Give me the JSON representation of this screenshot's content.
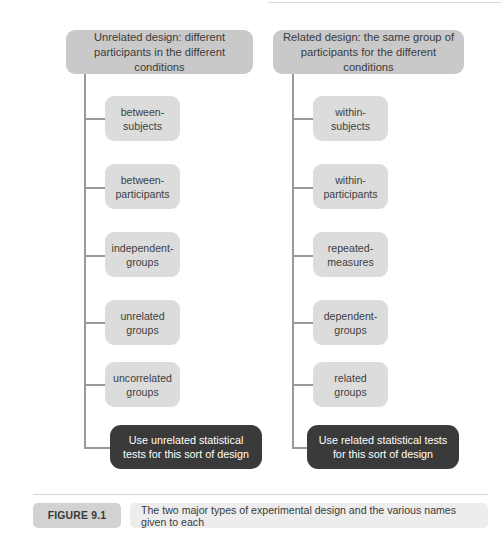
{
  "figure": {
    "columns": [
      {
        "id": "unrelated",
        "header": "Unrelated design: different participants in the different conditions",
        "nodes": [
          "between-subjects",
          "between-participants",
          "independent-groups",
          "unrelated groups",
          "uncorrelated groups"
        ],
        "conclusion": "Use unrelated statistical tests for this sort of design"
      },
      {
        "id": "related",
        "header": "Related design: the same group of participants for the different conditions",
        "nodes": [
          "within-subjects",
          "within-participants",
          "repeated-measures",
          "dependent-groups",
          "related groups"
        ],
        "conclusion": "Use related statistical tests for this sort of design"
      }
    ],
    "caption": {
      "label": "FIGURE 9.1",
      "text": "The two major types of experimental design and the various names given to each"
    },
    "colors": {
      "header_box": "#c9c9c9",
      "node_box": "#dcdcdc",
      "result_box": "#3a3a3a",
      "connector": "#9a9a9a",
      "caption_badge": "#d2d2d2",
      "caption_text_bg": "#ededed",
      "page_background": "#ffffff"
    }
  }
}
